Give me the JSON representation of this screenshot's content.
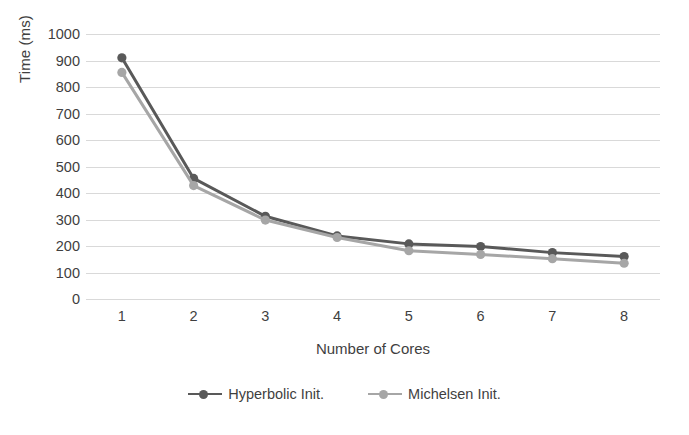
{
  "chart_data": {
    "type": "line",
    "title": "",
    "xlabel": "Number of Cores",
    "ylabel": "Time (ms)",
    "categories": [
      "1",
      "2",
      "3",
      "4",
      "5",
      "6",
      "7",
      "8"
    ],
    "ylim": [
      0,
      1000
    ],
    "yticks": [
      "1000",
      "900",
      "800",
      "700",
      "600",
      "500",
      "400",
      "300",
      "200",
      "100",
      "0"
    ],
    "ytick_values": [
      1000,
      900,
      800,
      700,
      600,
      500,
      400,
      300,
      200,
      100,
      0
    ],
    "grid": true,
    "legend_position": "bottom",
    "series": [
      {
        "name": "Hyperbolic Init.",
        "color": "#595959",
        "marker": "circle",
        "values": [
          910,
          455,
          312,
          238,
          208,
          198,
          175,
          160
        ]
      },
      {
        "name": "Michelsen Init.",
        "color": "#a6a6a6",
        "marker": "circle",
        "values": [
          855,
          428,
          298,
          232,
          182,
          168,
          152,
          135
        ]
      }
    ]
  }
}
